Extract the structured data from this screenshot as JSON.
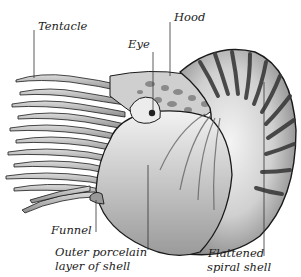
{
  "figure": {
    "labels": {
      "tentacle": "Tentacle",
      "hood": "Hood",
      "eye": "Eye",
      "funnel": "Funnel",
      "outer_porcelain_line1": "Outer porcelain",
      "outer_porcelain_line2": "layer of shell",
      "flattened_line1": "Flattened",
      "flattened_line2": "spiral shell"
    },
    "colors": {
      "ink": "#1a1a1a",
      "shell_light": "#e8e8e8",
      "shell_mid": "#b8b8b8",
      "stripe": "#3a3a3a",
      "leader_line": "#333333",
      "background": "#ffffff"
    }
  }
}
